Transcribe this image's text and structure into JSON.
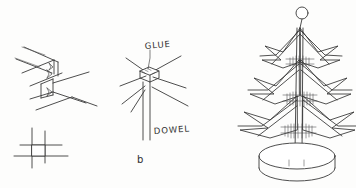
{
  "figure": {
    "background_color": "#fdfdfc",
    "ink_color": "#333333",
    "width": 356,
    "height": 188,
    "style": "hand-drawn pencil technical sketch"
  },
  "panels": [
    {
      "id": "a",
      "name": "notch-joint-detail",
      "caption": "",
      "description": "Isometric view of two V-notches cut into the edge of a board, with a plan-view cross section below",
      "labels": []
    },
    {
      "id": "b",
      "name": "glue-dowel-detail",
      "caption": "b",
      "description": "Branch spokes joined to a central dowel with a glue block",
      "labels": [
        {
          "name": "glue-label",
          "text": "GLUE"
        },
        {
          "name": "dowel-label",
          "text": "DOWEL"
        }
      ]
    },
    {
      "id": "c",
      "name": "assembled-tree",
      "caption": "",
      "description": "Completed Christmas tree with three tiers of zigzag branches, ball finial and round base",
      "labels": []
    }
  ],
  "annotations": {
    "glue": "GLUE",
    "dowel": "DOWEL",
    "panel_b_caption": "b"
  },
  "tree": {
    "finial": "ball",
    "tiers": 3,
    "base": "round disc"
  }
}
